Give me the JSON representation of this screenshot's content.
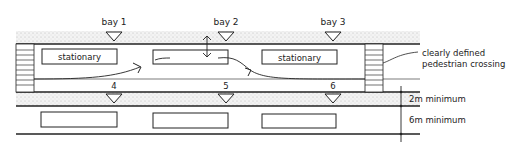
{
  "diagram": {
    "top_bays": [
      {
        "label": "bay 1",
        "x": 114
      },
      {
        "label": "bay 2",
        "x": 226
      },
      {
        "label": "bay 3",
        "x": 333
      }
    ],
    "bottom_bays": [
      {
        "label": "4",
        "x": 114
      },
      {
        "label": "5",
        "x": 226
      },
      {
        "label": "6",
        "x": 333
      }
    ],
    "upper_vehicles": [
      {
        "label": "stationary",
        "x": 42,
        "w": 75
      },
      {
        "label": "",
        "x": 153,
        "w": 75
      },
      {
        "label": "stationary",
        "x": 262,
        "w": 75
      }
    ],
    "lower_vehicles": [
      {
        "label": "",
        "x": 41,
        "w": 76
      },
      {
        "label": "",
        "x": 153,
        "w": 75
      },
      {
        "label": "",
        "x": 262,
        "w": 74
      }
    ],
    "crossing_callout": {
      "line1": "clearly defined",
      "line2": "pedestrian crossing"
    },
    "dimensions": [
      {
        "label": "2m minimum"
      },
      {
        "label": "6m minimum"
      }
    ],
    "colors": {
      "ink": "#222222",
      "stipple": "#c8c8c8",
      "background": "#ffffff"
    }
  }
}
